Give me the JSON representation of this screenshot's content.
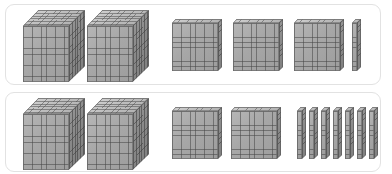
{
  "figure": {
    "kind": "base-ten-blocks-comparison",
    "background_color": "#ffffff",
    "panel_border_color": "#e2e2e2",
    "block_fill_color": "#a7a7a7",
    "block_line_color": "#6e6e6e",
    "rows": [
      {
        "id": "row-1",
        "groups": [
          {
            "type": "cube",
            "place_value": "thousands",
            "unit_value": 1000,
            "count": 2,
            "subtotal": 2000
          },
          {
            "type": "flat",
            "place_value": "hundreds",
            "unit_value": 100,
            "count": 3,
            "subtotal": 300
          },
          {
            "type": "rod",
            "place_value": "tens",
            "unit_value": 10,
            "count": 1,
            "subtotal": 10
          },
          {
            "type": "unit",
            "place_value": "ones",
            "unit_value": 1,
            "count": 0,
            "subtotal": 0
          }
        ],
        "total": 2310
      },
      {
        "id": "row-2",
        "groups": [
          {
            "type": "cube",
            "place_value": "thousands",
            "unit_value": 1000,
            "count": 2,
            "subtotal": 2000
          },
          {
            "type": "flat",
            "place_value": "hundreds",
            "unit_value": 100,
            "count": 2,
            "subtotal": 200
          },
          {
            "type": "rod",
            "place_value": "tens",
            "unit_value": 10,
            "count": 7,
            "subtotal": 70
          },
          {
            "type": "unit",
            "place_value": "ones",
            "unit_value": 1,
            "count": 0,
            "subtotal": 0
          }
        ],
        "total": 2270
      }
    ]
  },
  "chart_data": {
    "type": "bar",
    "title": "",
    "xlabel": "",
    "ylabel": "",
    "categories": [
      "Thousands",
      "Hundreds",
      "Tens",
      "Ones"
    ],
    "series": [
      {
        "name": "Row 1",
        "values": [
          2,
          3,
          1,
          0
        ]
      },
      {
        "name": "Row 2",
        "values": [
          2,
          2,
          7,
          0
        ]
      }
    ]
  }
}
